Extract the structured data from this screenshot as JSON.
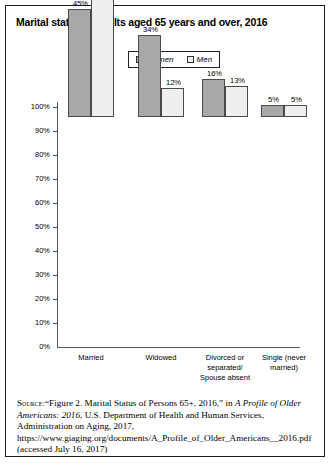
{
  "figure": {
    "title": "Marital status of adults aged 65 years and over, 2016"
  },
  "legend": {
    "position": "top-center",
    "entries": [
      {
        "label": "Women",
        "swatch": "legend-swatch-women",
        "color": "#a8a8a8"
      },
      {
        "label": "Men",
        "swatch": "legend-swatch-men",
        "color": "#eeeeee"
      }
    ]
  },
  "axes": {
    "y_ticks": [
      "100%",
      "90%",
      "80%",
      "70%",
      "60%",
      "50%",
      "40%",
      "30%",
      "20%",
      "10%",
      "0%"
    ],
    "x_categories": [
      "Married",
      "Widowed",
      "Divorced or separated/ Spouse absent",
      "Single (never married)"
    ]
  },
  "chart_data": {
    "type": "bar",
    "title": "Marital status of adults aged 65 years and over, 2016",
    "xlabel": "",
    "ylabel": "",
    "ylim": [
      0,
      100
    ],
    "ytick_step": 10,
    "grid": false,
    "legend_position": "top-center",
    "categories": [
      "Married",
      "Widowed",
      "Divorced or separated/ Spouse absent",
      "Single (never married)"
    ],
    "series": [
      {
        "name": "Women",
        "color": "#a8a8a8",
        "values": [
          45,
          34,
          16,
          5
        ],
        "data_labels": [
          "45%",
          "34%",
          "16%",
          "5%"
        ]
      },
      {
        "name": "Men",
        "color": "#eeeeee",
        "values": [
          70,
          12,
          13,
          5
        ],
        "data_labels": [
          "70%",
          "12%",
          "13%",
          "5%"
        ]
      }
    ]
  },
  "source": {
    "kicker": "Source:",
    "text_part1": "“Figure 2. Marital Status of Persons 65+, 2016,” in ",
    "italic1": "A Profile of Older Americans: 2016",
    "text_part2": ", U.S. Department of Health and Human Services, Administration on Aging, 2017, https://www.giaging.org/documents/A_Profile_of_Older_Americans__2016.pdf (accessed July 16, 2017)"
  }
}
